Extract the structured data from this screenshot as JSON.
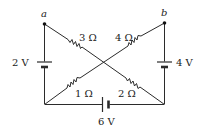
{
  "diagram": {
    "type": "circuit",
    "nodes": {
      "a": {
        "label": "a"
      },
      "b": {
        "label": "b"
      }
    },
    "batteries": [
      {
        "id": "left",
        "label": "2 V"
      },
      {
        "id": "right",
        "label": "4 V"
      },
      {
        "id": "bottom",
        "label": "6 V"
      }
    ],
    "resistors": [
      {
        "id": "r3",
        "label": "3 Ω"
      },
      {
        "id": "r4",
        "label": "4 Ω"
      },
      {
        "id": "r1",
        "label": "1 Ω"
      },
      {
        "id": "r2",
        "label": "2 Ω"
      }
    ],
    "colors": {
      "line": "#2b2b2b",
      "background": "#ffffff"
    }
  }
}
